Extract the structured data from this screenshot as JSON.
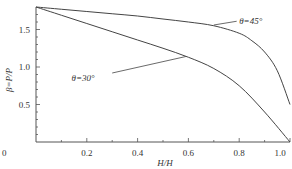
{
  "chart_data": {
    "type": "line",
    "title": "",
    "xlabel": "H/H",
    "ylabel": "β=P/P",
    "xlim": [
      0,
      1.0
    ],
    "ylim": [
      0,
      1.8
    ],
    "x_ticks": [
      "0",
      "0.2",
      "0.4",
      "0.6",
      "0.8",
      "1.0"
    ],
    "y_ticks": [
      "0.5",
      "1.0",
      "1.5"
    ],
    "grid": false,
    "series": [
      {
        "name": "θ=45°",
        "x": [
          0,
          0.1,
          0.2,
          0.3,
          0.4,
          0.5,
          0.6,
          0.7,
          0.8,
          0.85,
          0.9,
          0.95,
          1.0
        ],
        "values": [
          1.8,
          1.77,
          1.74,
          1.71,
          1.68,
          1.64,
          1.6,
          1.55,
          1.45,
          1.35,
          1.2,
          0.95,
          0.5
        ]
      },
      {
        "name": "θ=30°",
        "x": [
          0,
          0.1,
          0.2,
          0.3,
          0.4,
          0.5,
          0.6,
          0.7,
          0.8,
          0.9,
          1.0
        ],
        "values": [
          1.8,
          1.69,
          1.58,
          1.47,
          1.36,
          1.25,
          1.13,
          0.98,
          0.75,
          0.4,
          0.0
        ]
      }
    ],
    "annotations": [
      {
        "text": "θ=45°",
        "x": 0.78,
        "y": 1.58
      },
      {
        "text": "θ=30°",
        "x": 0.45,
        "y": 1.0
      }
    ]
  }
}
